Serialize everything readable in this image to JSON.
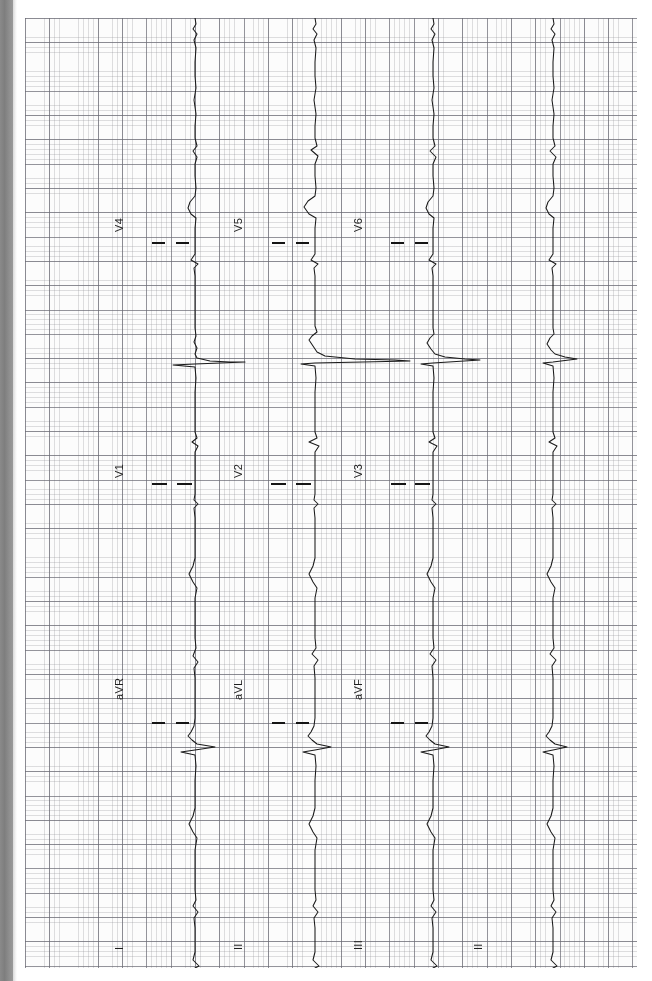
{
  "document": {
    "kind": "ecg-strip",
    "orientation": "rotated-90-ccw",
    "paper": {
      "background_color": "#fdfdfd",
      "minor_grid_color": "#96969b",
      "major_grid_color": "#696973",
      "minor_grid_px": 4.86,
      "major_grid_px": 24.3
    },
    "edge_strip_color": "#8a8a8a",
    "trace_color": "#1a1a1a"
  },
  "leads": [
    {
      "id": "V4",
      "label": "V4",
      "column": 1,
      "row": 1,
      "label_x": 113,
      "label_y": 232,
      "baseline_x": 170
    },
    {
      "id": "V5",
      "label": "V5",
      "column": 2,
      "row": 1,
      "label_x": 232,
      "label_y": 232,
      "baseline_x": 290
    },
    {
      "id": "V6",
      "label": "V6",
      "column": 3,
      "row": 1,
      "label_x": 352,
      "label_y": 232,
      "baseline_x": 408
    },
    {
      "id": "V1",
      "label": "V1",
      "column": 1,
      "row": 2,
      "label_x": 113,
      "label_y": 478,
      "baseline_x": 170
    },
    {
      "id": "V2",
      "label": "V2",
      "column": 2,
      "row": 2,
      "label_x": 232,
      "label_y": 478,
      "baseline_x": 290
    },
    {
      "id": "V3",
      "label": "V3",
      "column": 3,
      "row": 2,
      "label_x": 352,
      "label_y": 478,
      "baseline_x": 408
    },
    {
      "id": "aVR",
      "label": "aVR",
      "column": 1,
      "row": 3,
      "label_x": 113,
      "label_y": 700,
      "baseline_x": 170
    },
    {
      "id": "aVL",
      "label": "aVL",
      "column": 2,
      "row": 3,
      "label_x": 232,
      "label_y": 700,
      "baseline_x": 290
    },
    {
      "id": "aVF",
      "label": "aVF",
      "column": 3,
      "row": 3,
      "label_x": 352,
      "label_y": 700,
      "baseline_x": 408
    },
    {
      "id": "I",
      "label": "I",
      "column": 1,
      "row": 4,
      "label_x": 113,
      "label_y": 950,
      "baseline_x": 170
    },
    {
      "id": "II",
      "label": "II",
      "column": 2,
      "row": 4,
      "label_x": 232,
      "label_y": 950,
      "baseline_x": 290
    },
    {
      "id": "III",
      "label": "III",
      "column": 3,
      "row": 4,
      "label_x": 352,
      "label_y": 950,
      "baseline_x": 408
    },
    {
      "id": "II-rhythm",
      "label": "II",
      "column": 4,
      "row": 4,
      "label_x": 472,
      "label_y": 950,
      "baseline_x": 528
    }
  ],
  "calibration_ticks": [
    {
      "lead": "V4",
      "x": 152,
      "y": 242,
      "w": 13
    },
    {
      "lead": "V4",
      "x": 176,
      "y": 242,
      "w": 13
    },
    {
      "lead": "V5",
      "x": 272,
      "y": 242,
      "w": 13
    },
    {
      "lead": "V5",
      "x": 296,
      "y": 242,
      "w": 13
    },
    {
      "lead": "V6",
      "x": 391,
      "y": 242,
      "w": 13
    },
    {
      "lead": "V6",
      "x": 415,
      "y": 242,
      "w": 13
    },
    {
      "lead": "V1",
      "x": 152,
      "y": 483,
      "w": 15
    },
    {
      "lead": "V1",
      "x": 177,
      "y": 483,
      "w": 15
    },
    {
      "lead": "V2",
      "x": 271,
      "y": 483,
      "w": 15
    },
    {
      "lead": "V2",
      "x": 296,
      "y": 483,
      "w": 15
    },
    {
      "lead": "V3",
      "x": 391,
      "y": 483,
      "w": 15
    },
    {
      "lead": "V3",
      "x": 415,
      "y": 483,
      "w": 15
    },
    {
      "lead": "aVR",
      "x": 152,
      "y": 722,
      "w": 13
    },
    {
      "lead": "aVR",
      "x": 176,
      "y": 722,
      "w": 13
    },
    {
      "lead": "aVL",
      "x": 272,
      "y": 722,
      "w": 13
    },
    {
      "lead": "aVL",
      "x": 296,
      "y": 722,
      "w": 13
    },
    {
      "lead": "aVF",
      "x": 391,
      "y": 722,
      "w": 13
    },
    {
      "lead": "aVF",
      "x": 415,
      "y": 722,
      "w": 13
    }
  ],
  "chart_data": {
    "type": "line",
    "xlabel": "",
    "ylabel": "",
    "grid": true,
    "legend": "none",
    "note": "Signal runs top-to-bottom on the page; amplitude deflects left/right from each column baseline.",
    "series": [
      {
        "name": "V4",
        "baseline_x": 170,
        "points": "M170,0 L171,6 L168,11 L172,16 L169,22 L171,30 L170,44 L170,58 L171,70 L169,82 L171,96 L170,108 L170,120 L172,128 L168,133 L172,139 L170,146 L170,158 L171,170 L170,178 L165,184 L163,190 L166,196 L171,200 L170,210 L170,222 L170,236 L166,242 L173,246 L169,250 L170,258 L170,272 L170,288 L170,300 L170,310 L171,318 L169,324 L172,330 L170,336 L172,340 L185,343 L205,344 L220,344 L170,346 L148,347 L170,349 L171,360 L170,374 L170,390 L170,404 L170,414 L172,420 L167,424 L173,428 L170,434 L170,448 L170,462 L170,476 L169,482 L173,486 L169,490 L170,500 L170,514 L170,528 L170,540 L168,548 L164,556 L168,564 L172,570 L170,580 L170,594 L170,608 L170,620 L171,630 L168,638 L173,644 L169,650 L170,660 L170,674 L170,688 L170,700 L169,708 L166,714 L163,718 L167,722 L172,726 L190,729 L170,732 L156,734 L170,737 L171,748 L170,762 L170,776 L170,790 L168,798 L164,806 L168,814 L172,820 L170,832 L170,846 L170,860 L170,872 L171,882 L168,888 L173,894 L169,900 L170,910 L170,922 L170,934 L168,942 L174,948 L170,950"
      },
      {
        "name": "V5",
        "baseline_x": 290,
        "points": "M290,0 L291,6 L288,11 L292,16 L289,22 L291,30 L290,44 L290,58 L291,70 L289,82 L291,96 L290,108 L290,120 L292,128 L286,132 L293,138 L290,146 L290,158 L291,170 L290,178 L283,183 L279,189 L284,196 L291,200 L290,210 L290,222 L290,236 L286,242 L293,246 L289,250 L290,258 L290,272 L290,288 L290,300 L290,308 L292,314 L287,318 L284,322 L288,328 L292,334 L300,338 L330,341 L370,342 L385,343 L290,345 L276,346 L290,348 L291,360 L290,374 L290,390 L290,404 L290,414 L292,420 L284,424 L294,428 L290,434 L290,448 L290,462 L290,476 L289,482 L293,486 L289,490 L290,500 L290,514 L290,528 L290,540 L288,548 L284,556 L288,564 L292,570 L290,580 L290,594 L290,608 L290,620 L291,630 L287,636 L293,642 L289,648 L290,660 L290,674 L290,688 L290,700 L289,708 L286,714 L283,718 L287,722 L292,726 L306,729 L290,732 L278,734 L290,737 L291,748 L290,762 L290,776 L290,790 L288,798 L284,806 L288,814 L292,820 L290,832 L290,846 L290,860 L290,872 L291,882 L288,888 L293,894 L289,900 L290,910 L290,922 L290,934 L288,942 L294,948 L290,950"
      },
      {
        "name": "V6",
        "baseline_x": 408,
        "points": "M408,0 L409,6 L406,11 L410,16 L407,22 L409,30 L408,44 L408,58 L409,70 L407,82 L409,96 L408,108 L408,120 L410,128 L405,133 L411,139 L408,146 L408,158 L409,170 L408,178 L403,184 L401,190 L404,196 L409,200 L408,210 L408,222 L408,236 L404,242 L411,246 L407,250 L408,258 L408,272 L408,288 L408,300 L408,310 L409,316 L405,320 L402,325 L406,331 L410,336 L420,339 L440,341 L455,342 L408,345 L396,346 L408,348 L409,360 L408,374 L408,390 L408,404 L408,414 L410,420 L404,424 L412,428 L408,434 L408,448 L408,462 L408,476 L407,482 L411,486 L407,490 L408,500 L408,514 L408,528 L408,540 L406,548 L402,556 L406,564 L410,570 L408,580 L408,594 L408,608 L408,620 L409,630 L405,636 L411,642 L407,648 L408,660 L408,674 L408,688 L408,700 L407,708 L404,714 L401,718 L405,722 L410,726 L424,729 L408,732 L396,734 L408,737 L409,748 L408,762 L408,776 L408,790 L406,798 L402,806 L406,814 L410,820 L408,832 L408,846 L408,860 L408,872 L409,882 L406,888 L411,894 L407,900 L408,910 L408,922 L408,934 L406,942 L412,948 L408,950"
      },
      {
        "name": "II-rhythm",
        "baseline_x": 528,
        "points": "M528,0 L529,6 L526,11 L530,16 L527,22 L529,30 L528,44 L528,58 L529,70 L527,82 L529,96 L528,108 L528,120 L530,128 L525,133 L531,139 L528,146 L528,158 L529,170 L528,178 L523,184 L521,190 L524,196 L529,200 L528,210 L528,222 L528,236 L524,242 L531,246 L527,250 L528,258 L528,272 L528,288 L528,300 L528,310 L529,316 L525,320 L522,326 L526,332 L530,336 L540,339 L552,341 L528,344 L518,345 L528,348 L529,360 L528,374 L528,390 L528,404 L528,414 L530,420 L524,424 L532,428 L528,434 L528,448 L528,462 L528,476 L527,482 L531,486 L527,490 L528,500 L528,514 L528,528 L528,540 L526,548 L522,556 L526,564 L530,570 L528,580 L528,594 L528,608 L528,620 L529,630 L525,636 L531,642 L527,648 L528,660 L528,674 L528,688 L528,700 L527,708 L524,714 L521,718 L525,722 L530,726 L542,729 L528,732 L518,734 L528,737 L529,748 L528,762 L528,776 L528,790 L526,798 L522,806 L526,814 L530,820 L528,832 L528,846 L528,860 L528,872 L529,882 L526,888 L531,894 L527,900 L528,910 L528,922 L528,934 L526,942 L532,948 L528,950"
      }
    ]
  }
}
